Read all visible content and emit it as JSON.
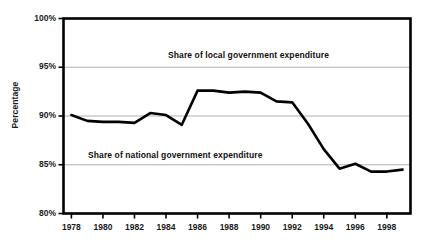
{
  "chart_data": {
    "type": "line",
    "title": "",
    "subtitle": "",
    "xlabel": "",
    "ylabel": "Percentage",
    "xlim": [
      1977.5,
      1999.5
    ],
    "ylim": [
      80,
      100
    ],
    "y_tick_labels": [
      "100%",
      "95%",
      "90%",
      "85%",
      "80%"
    ],
    "y_ticks": [
      100,
      95,
      90,
      85,
      80
    ],
    "x_tick_labels": [
      "1978",
      "1980",
      "1982",
      "1984",
      "1986",
      "1988",
      "1990",
      "1992",
      "1994",
      "1996",
      "1998"
    ],
    "x_ticks": [
      1978,
      1980,
      1982,
      1984,
      1986,
      1988,
      1990,
      1992,
      1994,
      1996,
      1998
    ],
    "grid": "horizontal",
    "gridlines": [
      95,
      90,
      85
    ],
    "legend": "none",
    "line_color": "#000000",
    "grid_color": "#a8a8a8",
    "frame_color": "#000000",
    "annotations": [
      {
        "text": "Share of local government expenditure",
        "x": 1988,
        "y": 96.6
      },
      {
        "text": "Share of national government expenditure",
        "x": 1983.5,
        "y": 86.2
      }
    ],
    "series": [
      {
        "name": "Share of national government expenditure",
        "x": [
          1978,
          1979,
          1980,
          1981,
          1982,
          1983,
          1984,
          1985,
          1986,
          1987,
          1988,
          1989,
          1990,
          1991,
          1992,
          1993,
          1994,
          1995,
          1996,
          1997,
          1998,
          1999
        ],
        "values": [
          90.1,
          89.5,
          89.4,
          89.4,
          89.3,
          90.3,
          90.1,
          89.1,
          92.6,
          92.6,
          92.4,
          92.5,
          92.4,
          91.5,
          91.4,
          89.2,
          86.6,
          84.6,
          85.1,
          84.3,
          84.3,
          84.5
        ]
      }
    ]
  }
}
